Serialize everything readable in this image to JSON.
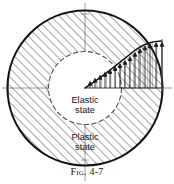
{
  "figure": {
    "caption_prefix": "Fig.",
    "caption_number": "4-7",
    "caption_full": "Fig. 4-7",
    "labels": {
      "elastic_line1": "Elastic",
      "elastic_line2": "state",
      "plastic_line1": "Plastic",
      "plastic_line2": "state"
    },
    "colors": {
      "outline": "#111111",
      "hatch": "#2b2b2b",
      "centerline": "#8c8c8c",
      "inner_circle": "#4a4a4a",
      "curve": "#0d0d0d",
      "arrow": "#1a1a1a",
      "background": "#ffffff",
      "text": "#141414"
    },
    "geometry": {
      "center_x": 85,
      "center_y": 88,
      "outer_radius": 78,
      "inner_radius": 37,
      "stress_right_x": 162,
      "stress_peak_y": 42
    },
    "regions": [
      {
        "name": "plastic-annulus",
        "hatched": true
      },
      {
        "name": "elastic-core",
        "hatched": false
      }
    ],
    "stress_profile": {
      "description": "radial stress distribution over plastic zone",
      "x_start": 85,
      "x_end": 162,
      "arrow_count": 15
    }
  }
}
